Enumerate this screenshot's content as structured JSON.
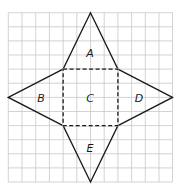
{
  "diagram": {
    "type": "net of square pyramid on grid",
    "grid": {
      "columns": 12,
      "rows": 12,
      "line_color": "#c8c8c8"
    },
    "faces": [
      {
        "id": "A",
        "label": "A",
        "shape": "triangle",
        "position": "top"
      },
      {
        "id": "B",
        "label": "B",
        "shape": "triangle",
        "position": "left"
      },
      {
        "id": "C",
        "label": "C",
        "shape": "square",
        "position": "center"
      },
      {
        "id": "D",
        "label": "D",
        "shape": "triangle",
        "position": "right"
      },
      {
        "id": "E",
        "label": "E",
        "shape": "triangle",
        "position": "bottom"
      }
    ],
    "fold_line_style": "dashed",
    "outline_color": "#1a1a1a"
  }
}
